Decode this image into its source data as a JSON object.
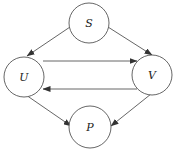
{
  "diagram": {
    "type": "directed-graph",
    "colors": {
      "stroke": "#555555",
      "label": "#222222",
      "background": "#ffffff"
    },
    "nodes": [
      {
        "id": "S",
        "label": "S",
        "cx": 89,
        "cy": 23,
        "r": 20
      },
      {
        "id": "U",
        "label": "U",
        "cx": 24,
        "cy": 77,
        "r": 20
      },
      {
        "id": "V",
        "label": "V",
        "cx": 152,
        "cy": 75,
        "r": 20
      },
      {
        "id": "P",
        "label": "P",
        "cx": 90,
        "cy": 127,
        "r": 21
      }
    ],
    "edges": [
      {
        "from": "S",
        "to": "U",
        "x1": 70,
        "y1": 27,
        "x2": 27,
        "y2": 56
      },
      {
        "from": "S",
        "to": "V",
        "x1": 108,
        "y1": 27,
        "x2": 152,
        "y2": 55
      },
      {
        "from": "U",
        "to": "V",
        "x1": 43,
        "y1": 61,
        "x2": 137,
        "y2": 61
      },
      {
        "from": "V",
        "to": "U",
        "x1": 137,
        "y1": 89,
        "x2": 43,
        "y2": 89
      },
      {
        "from": "U",
        "to": "P",
        "x1": 26,
        "y1": 95,
        "x2": 71,
        "y2": 126
      },
      {
        "from": "V",
        "to": "P",
        "x1": 151,
        "y1": 94,
        "x2": 111,
        "y2": 126
      }
    ]
  }
}
